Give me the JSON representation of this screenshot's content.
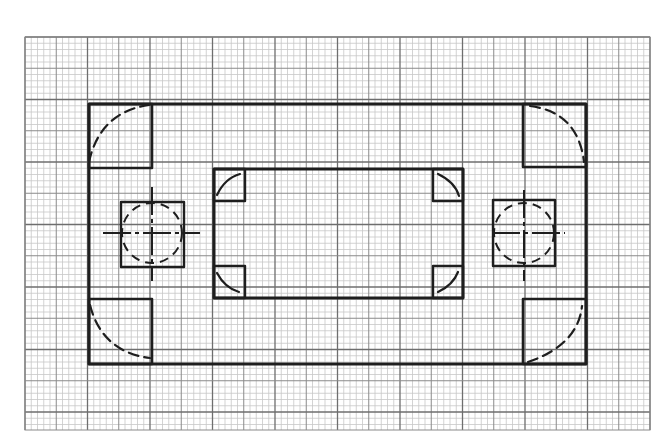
{
  "drawing": {
    "type": "hand-drawn plate layout on graph paper",
    "colors": {
      "background": "#ffffff",
      "grid_minor": "#c8c8c8",
      "grid_major": "#8a8a8a",
      "grid_major_dark": "#6e6e6e",
      "ink": "#1e1e1e"
    },
    "grid": {
      "x0": 25,
      "y0": 37,
      "x1": 650,
      "y1": 430,
      "major_spacing": 31.25,
      "minor_per_major": 5,
      "dark_every": 2
    },
    "outer_rect": {
      "x": 89,
      "y": 104,
      "w": 497,
      "h": 260
    },
    "corner_boxes": [
      {
        "id": "top-left",
        "x": 89,
        "y": 104,
        "w": 63,
        "h": 64,
        "arc": "M89,162 Q100,112 149,105"
      },
      {
        "id": "top-right",
        "x": 523,
        "y": 104,
        "w": 63,
        "h": 63,
        "arc": "M530,106 Q578,112 584,162"
      },
      {
        "id": "bottom-left",
        "x": 89,
        "y": 299,
        "w": 63,
        "h": 65,
        "arc": "M90,305 Q102,352 150,358"
      },
      {
        "id": "bottom-right",
        "x": 523,
        "y": 299,
        "w": 63,
        "h": 65,
        "arc": "M528,362 Q578,345 582,306"
      }
    ],
    "inner_rect": {
      "x": 214,
      "y": 169,
      "w": 249,
      "h": 129
    },
    "inner_corner_boxes": [
      {
        "id": "inner-top-left",
        "x": 214,
        "y": 169,
        "w": 31,
        "h": 32,
        "arc": "M217,195 Q225,178 240,174"
      },
      {
        "id": "inner-top-right",
        "x": 433,
        "y": 169,
        "w": 30,
        "h": 32,
        "arc": "M438,174 Q455,182 459,196"
      },
      {
        "id": "inner-bottom-left",
        "x": 214,
        "y": 266,
        "w": 31,
        "h": 32,
        "arc": "M217,273 Q225,288 239,292"
      },
      {
        "id": "inner-bottom-right",
        "x": 433,
        "y": 266,
        "w": 30,
        "h": 32,
        "arc": "M438,292 Q453,285 458,272"
      }
    ],
    "holes": [
      {
        "id": "left-hole",
        "square": {
          "x": 121,
          "y": 202,
          "w": 63,
          "h": 65
        },
        "cx": 152,
        "cy": 233,
        "r": 30,
        "h_line": [
          103,
          200
        ],
        "v_line": [
          187,
          281
        ]
      },
      {
        "id": "right-hole",
        "square": {
          "x": 493,
          "y": 200,
          "w": 62,
          "h": 66
        },
        "cx": 524,
        "cy": 233,
        "r": 30,
        "h_line": [
          492,
          565
        ],
        "v_line": [
          190,
          281
        ]
      }
    ]
  }
}
